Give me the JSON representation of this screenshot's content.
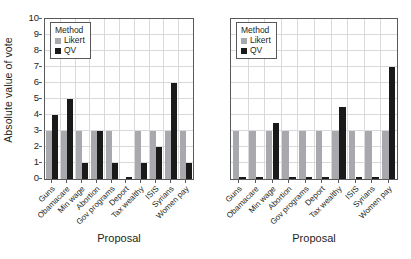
{
  "chart_data": [
    {
      "panel": "left",
      "type": "bar",
      "title": "",
      "xlabel": "Proposal",
      "ylabel": "Absolute value of vote",
      "ylim": [
        0,
        10
      ],
      "yticks": [
        0,
        1,
        2,
        3,
        4,
        5,
        6,
        7,
        8,
        9,
        10
      ],
      "grid": true,
      "legend": {
        "title": "Method",
        "position": "upper-left",
        "entries": [
          {
            "name": "Likert",
            "color": "#a7a9ac"
          },
          {
            "name": "QV",
            "color": "#1a1a1a"
          }
        ]
      },
      "categories": [
        "Guns",
        "Obamacare",
        "Min wage",
        "Abortion",
        "Gov programs",
        "Deport",
        "Tax wealthy",
        "ISIS",
        "Syrians",
        "Women pay"
      ],
      "series": [
        {
          "name": "Likert",
          "color": "#a7a9ac",
          "values": [
            3,
            3,
            3,
            3,
            3,
            0,
            3,
            3,
            3,
            3
          ]
        },
        {
          "name": "QV",
          "color": "#1a1a1a",
          "values": [
            4,
            5,
            1,
            3,
            1,
            0.1,
            1,
            2,
            6,
            1
          ]
        }
      ]
    },
    {
      "panel": "right",
      "type": "bar",
      "title": "",
      "xlabel": "Proposal",
      "ylabel": "",
      "ylim": [
        0,
        10
      ],
      "yticks": [
        0,
        1,
        2,
        3,
        4,
        5,
        6,
        7,
        8,
        9,
        10
      ],
      "grid": true,
      "legend": {
        "title": "Method",
        "position": "upper-left",
        "entries": [
          {
            "name": "Likert",
            "color": "#a7a9ac"
          },
          {
            "name": "QV",
            "color": "#1a1a1a"
          }
        ]
      },
      "categories": [
        "Guns",
        "Obamacare",
        "Min wage",
        "Abortion",
        "Gov programs",
        "Deport",
        "Tax wealthy",
        "ISIS",
        "Syrians",
        "Women pay"
      ],
      "series": [
        {
          "name": "Likert",
          "color": "#a7a9ac",
          "values": [
            3,
            3,
            3,
            3,
            3,
            3,
            3,
            3,
            3,
            3
          ]
        },
        {
          "name": "QV",
          "color": "#1a1a1a",
          "values": [
            0.1,
            0.1,
            3.5,
            0.1,
            0.1,
            0.1,
            4.5,
            0.1,
            0.1,
            7
          ]
        }
      ]
    }
  ],
  "axis": {
    "ylabel": "Absolute value of vote",
    "xlabel": "Proposal"
  },
  "legend": {
    "title": "Method",
    "likert": "Likert",
    "qv": "QV"
  },
  "colors": {
    "likert": "#a7a9ac",
    "qv": "#1a1a1a",
    "grid": "#d9d9d9",
    "frame": "#58595b"
  }
}
